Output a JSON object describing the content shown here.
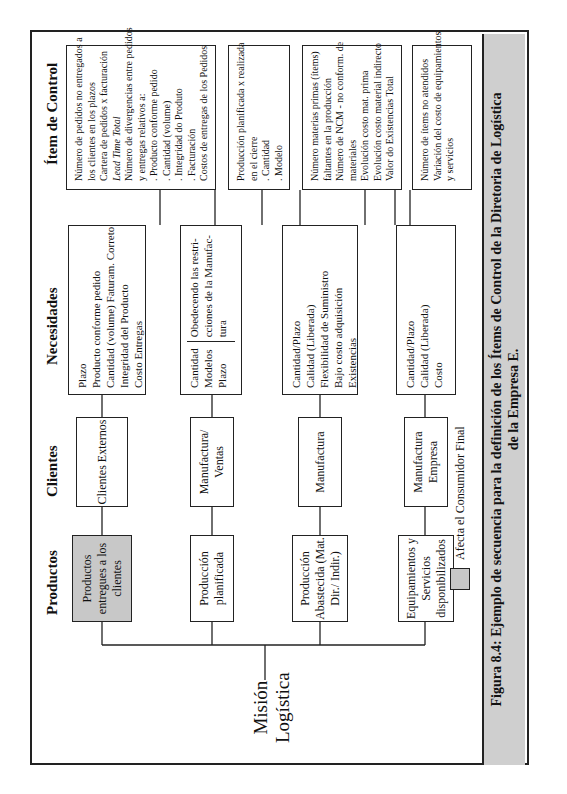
{
  "headers": {
    "productos": "Productos",
    "clientes": "Clientes",
    "necesidades": "Necesidades",
    "item_control": "Ítem de Control"
  },
  "mission": {
    "line1": "Misión",
    "line2": "Logística"
  },
  "rows": [
    {
      "producto": "Productos entregues a los clientes",
      "producto_shaded": true,
      "cliente": "Clientes Externos",
      "necesidades": [
        "Plazo",
        "Producto conforme pedido",
        "Cantidad (volume) Faturam. Correto",
        "Integridad del Producto",
        "Costo Entregas"
      ],
      "controles": [
        "Número de pedidos no entregados a",
        "los clientes en los plazos",
        "Cartera de pedidos x facturación",
        "Lead Time Total",
        "Número de divergencias entre pedidos",
        "y entregas relativos a:",
        ". Producto conforme pedido",
        ". Cantidad (volume)",
        ". Integridad do Produto",
        ". Facturación",
        "Costos de entregas de los Pedidos"
      ]
    },
    {
      "producto": "Producción planificada",
      "producto_shaded": false,
      "cliente": "Manufactura/ Ventas",
      "necesidades": [
        "Cantidad",
        "Modelos",
        "Plazo"
      ],
      "necesidades_nota": [
        "Obedecendo las restri-",
        "cciones de la Manufac-",
        "tura"
      ],
      "controles": [
        "Producción planificada x realizada",
        "en el cierre",
        ". Cantidad",
        ". Modelo"
      ]
    },
    {
      "producto": "Producción Abastecida (Mat. Dir./ Indir.)",
      "producto_shaded": false,
      "cliente": "Manufactura",
      "necesidades": [
        "Cantidad/Plazo",
        "Calidad (Liberada)",
        "Flexibilidad de Suministro",
        "Bajo costo adquisición",
        "Existencias"
      ],
      "controles": [
        "Número materias primas (ítems)",
        "faltantes en la producción",
        "Número de NCM - no conform. de",
        "materiales",
        "Evolución costo mat. prima",
        "Evolución costo material indirecto",
        "Valor do Existencias Total"
      ]
    },
    {
      "producto": "Equipamientos y Servicios disponibilizados",
      "producto_shaded": false,
      "cliente": "Manufactura Empresa",
      "necesidades": [
        "Cantidad/Plazo",
        "Calidad (Liberada)",
        "Costo"
      ],
      "controles": [
        "Número de ítems no atendidos",
        "Variación del costo de equipamientos",
        "y servicios"
      ]
    }
  ],
  "legend": {
    "label": "Afecta el Consumidor Final",
    "color": "#c8c8c8"
  },
  "caption": {
    "line1": "Figura 8.4: Ejemplo de secuencia para la definición de los Ítems de Control de la Diretoria de Logística",
    "line2": "de la Empresa E."
  }
}
